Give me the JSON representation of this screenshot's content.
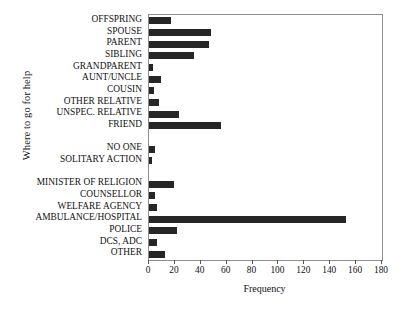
{
  "chart_data": {
    "type": "bar",
    "orientation": "horizontal",
    "title": "",
    "xlabel": "Frequency",
    "ylabel": "Where to go for help",
    "xlim": [
      0,
      180
    ],
    "xticks": [
      0,
      20,
      40,
      60,
      80,
      100,
      120,
      140,
      160,
      180
    ],
    "grid": false,
    "legend": null,
    "bar_color": "#262626",
    "frame_color": "#8d8d8d",
    "categories": [
      "OFFSPRING",
      "SPOUSE",
      "PARENT",
      "SIBLING",
      "GRANDPARENT",
      "AUNT/UNCLE",
      "COUSIN",
      "OTHER RELATIVE",
      "UNSPEC. RELATIVE",
      "FRIEND",
      "NO ONE",
      "SOLITARY ACTION",
      "MINISTER OF RELIGION",
      "COUNSELLOR",
      "WELFARE AGENCY",
      "AMBULANCE/HOSPITAL",
      "POLICE",
      "DCS, ADC",
      "OTHER"
    ],
    "values": [
      17,
      48,
      46,
      35,
      3,
      9,
      4,
      8,
      23,
      56,
      5,
      2,
      19,
      5,
      6,
      152,
      22,
      6,
      12
    ],
    "gaps_after": [
      9,
      11
    ]
  }
}
